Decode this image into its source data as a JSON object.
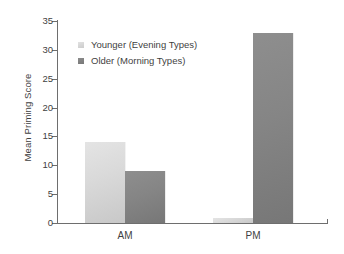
{
  "chart_data": {
    "type": "bar",
    "title": "",
    "xlabel": "",
    "ylabel": "Mean Priming Score",
    "categories": [
      "AM",
      "PM"
    ],
    "series": [
      {
        "name": "Younger (Evening Types)",
        "values": [
          14,
          0.8
        ],
        "color": "#d8d8d8"
      },
      {
        "name": "Older (Morning Types)",
        "values": [
          9,
          33
        ],
        "color": "#848484"
      }
    ],
    "ylim": [
      0,
      35
    ],
    "yticks": [
      0,
      5,
      10,
      15,
      20,
      25,
      30,
      35
    ],
    "ytick_labels": [
      "0",
      "5",
      "10",
      "15",
      "20",
      "25",
      "30",
      "35"
    ],
    "grid": false,
    "legend_position": "upper left"
  },
  "legend": {
    "items": [
      {
        "label": "Younger (Evening Types)"
      },
      {
        "label": "Older (Morning Types)"
      }
    ]
  },
  "axes": {
    "y_title": "Mean Priming Score",
    "y_labels": [
      "35",
      "30",
      "25",
      "20",
      "15",
      "10",
      "5",
      "0"
    ],
    "x_labels": [
      "AM",
      "PM"
    ]
  }
}
